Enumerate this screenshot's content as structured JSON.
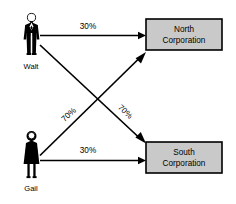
{
  "diagram": {
    "type": "flow-diagram",
    "title": "",
    "background_color": "#ffffff",
    "line_color": "#000000",
    "box_fill_color": "#c9c9c9",
    "persons": [
      {
        "id": "walt",
        "label": "Walt",
        "icon": "male-person-icon",
        "x": 31,
        "y": 35
      },
      {
        "id": "gail",
        "label": "Gail",
        "icon": "female-person-icon",
        "x": 31,
        "y": 155
      }
    ],
    "entities": [
      {
        "id": "north",
        "line1": "North",
        "line2": "Corporation",
        "x": 146,
        "y": 19,
        "width": 76,
        "height": 31
      },
      {
        "id": "south",
        "line1": "South",
        "line2": "Corporation",
        "x": 146,
        "y": 142,
        "width": 76,
        "height": 31
      }
    ],
    "edges": [
      {
        "id": "walt-north",
        "from": "walt",
        "to": "north",
        "label": "30%",
        "label_rotation": 0
      },
      {
        "id": "walt-south",
        "from": "walt",
        "to": "south",
        "label": "70%",
        "label_rotation": 43
      },
      {
        "id": "gail-north",
        "from": "gail",
        "to": "north",
        "label": "70%",
        "label_rotation": -43
      },
      {
        "id": "gail-south",
        "from": "gail",
        "to": "south",
        "label": "30%",
        "label_rotation": 0
      }
    ]
  }
}
